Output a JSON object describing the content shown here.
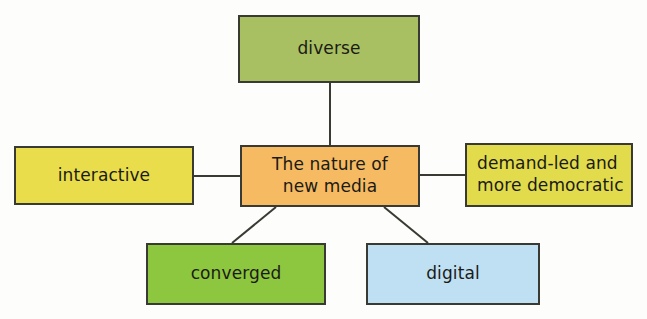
{
  "diagram": {
    "type": "mind-map",
    "background_color": "#fdfdfb",
    "border_color": "#3a3a34",
    "center": {
      "id": "center",
      "label": "The nature of\nnew media",
      "color": "#f6ba62"
    },
    "branches": [
      {
        "id": "diverse",
        "label": "diverse",
        "color": "#a9c062",
        "position": "top"
      },
      {
        "id": "interactive",
        "label": "interactive",
        "color": "#e9dd4b",
        "position": "left"
      },
      {
        "id": "demand-led",
        "label": "demand-led and\nmore democratic",
        "color": "#e2db4c",
        "position": "right"
      },
      {
        "id": "converged",
        "label": "converged",
        "color": "#8dc63f",
        "position": "bottom-left"
      },
      {
        "id": "digital",
        "label": "digital",
        "color": "#bfdff3",
        "position": "bottom-right"
      }
    ],
    "connectors": [
      {
        "from": "center",
        "to": "diverse",
        "x1": 330,
        "y1": 145,
        "x2": 330,
        "y2": 83
      },
      {
        "from": "center",
        "to": "interactive",
        "x1": 240,
        "y1": 176,
        "x2": 194,
        "y2": 176
      },
      {
        "from": "center",
        "to": "demand-led",
        "x1": 420,
        "y1": 175,
        "x2": 465,
        "y2": 175
      },
      {
        "from": "center",
        "to": "converged",
        "x1": 276,
        "y1": 207,
        "x2": 232,
        "y2": 243
      },
      {
        "from": "center",
        "to": "digital",
        "x1": 384,
        "y1": 207,
        "x2": 428,
        "y2": 243
      }
    ]
  }
}
